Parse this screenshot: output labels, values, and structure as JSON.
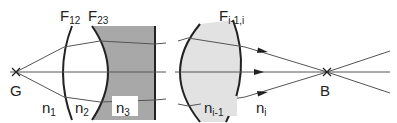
{
  "diagram": {
    "points": {
      "object": {
        "label": "G"
      },
      "image": {
        "label": "B"
      }
    },
    "surfaces": [
      {
        "label_main": "F",
        "label_sub": "12"
      },
      {
        "label_main": "F",
        "label_sub": "23"
      },
      {
        "label_main": "F",
        "label_sub": "i-1,i"
      }
    ],
    "media": [
      {
        "label_main": "n",
        "label_sub": "1"
      },
      {
        "label_main": "n",
        "label_sub": "2"
      },
      {
        "label_main": "n",
        "label_sub": "3"
      },
      {
        "label_main": "n",
        "label_sub": "i-1"
      },
      {
        "label_main": "n",
        "label_sub": "i"
      }
    ],
    "colors": {
      "line": "#222222",
      "ray": "#555555",
      "medium3_fill": "#a8a8a8",
      "lens_fill": "#e2e2e2",
      "background": "#ffffff"
    }
  }
}
